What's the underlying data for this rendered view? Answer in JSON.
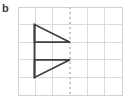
{
  "panel": {
    "label": "b"
  },
  "colors": {
    "background": "#ffffff",
    "grid_line": "#dcdcdc",
    "grid_border": "#d2d2d2",
    "mirror_line": "#b9b9b9",
    "shape_stroke": "#3d3d3d",
    "label_text": "#3b3b3b"
  },
  "diagram": {
    "type": "reflection-symmetry-grid",
    "grid": {
      "columns": 6,
      "rows": 5,
      "cell_width": 17.33,
      "cell_height": 17.6,
      "origin_x": 18,
      "origin_y": 7,
      "x_lines": [
        18,
        35.3,
        52.7,
        70,
        87.3,
        104.7,
        122
      ],
      "y_lines": [
        7,
        24.6,
        42.2,
        59.8,
        77.4,
        95
      ],
      "visible": true
    },
    "mirror_line": {
      "orientation": "vertical",
      "x": 70,
      "y_start": 7,
      "y_end": 95,
      "style": "dashed",
      "dash_pattern": "2 3",
      "width": 1.6
    },
    "shapes": [
      {
        "name": "upper-triangle",
        "kind": "right-triangle",
        "points": "34.5,24.6 34.5,42.2 70,42.2",
        "apex_on_mirror": true,
        "orientation": "points-right-downward"
      },
      {
        "name": "lower-triangle",
        "kind": "right-triangle",
        "points": "34.5,59.8 70,59.8 34.5,77.4",
        "apex_on_mirror": true,
        "orientation": "points-right-upward"
      },
      {
        "name": "shared-vertical-edge",
        "kind": "line",
        "x1": 34.5,
        "y1": 24.6,
        "x2": 34.5,
        "y2": 77.4
      }
    ],
    "stroke_width": 1.7
  }
}
